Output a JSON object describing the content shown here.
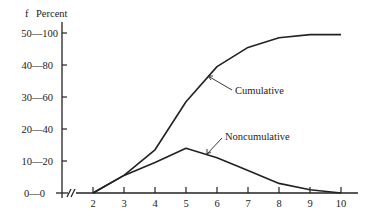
{
  "chart_data": {
    "type": "line",
    "title": "",
    "xlabel": "",
    "ylabel_left_f": "f",
    "ylabel_left_percent": "Percent",
    "x": [
      2,
      3,
      4,
      5,
      6,
      7,
      8,
      9,
      10
    ],
    "x_tick_labels": [
      "2",
      "3",
      "4",
      "5",
      "6",
      "7",
      "8",
      "9",
      "10"
    ],
    "y_ticks": [
      {
        "f": "0",
        "percent": "0",
        "label": "0—0"
      },
      {
        "f": "10",
        "percent": "20",
        "label": "10—20"
      },
      {
        "f": "20",
        "percent": "40",
        "label": "20—40"
      },
      {
        "f": "30",
        "percent": "60",
        "label": "30—60"
      },
      {
        "f": "40",
        "percent": "80",
        "label": "40—80"
      },
      {
        "f": "50",
        "percent": "100",
        "label": "50—100"
      }
    ],
    "ylim_percent": [
      0,
      100
    ],
    "ylim_f": [
      0,
      50
    ],
    "axis_break": true,
    "grid": false,
    "legend": "none (curves labeled directly with arrows)",
    "series": [
      {
        "name": "Cumulative",
        "unit": "percent",
        "values": [
          0,
          11,
          27,
          57,
          79,
          91,
          97,
          99,
          99
        ]
      },
      {
        "name": "Noncumulative",
        "unit": "percent",
        "values": [
          0,
          11,
          19,
          28,
          22,
          14,
          6,
          2,
          0
        ]
      }
    ],
    "annotations": [
      {
        "text": "Cumulative",
        "points_to_x": 5.6
      },
      {
        "text": "Noncumulative",
        "points_to_x": 5.7
      }
    ]
  },
  "labels": {
    "f": "f",
    "percent": "Percent",
    "cumulative": "Cumulative",
    "noncumulative": "Noncumulative",
    "y0": "0—0",
    "y10": "10—20",
    "y20": "20—40",
    "y30": "30—60",
    "y40": "40—80",
    "y50": "50—100",
    "x2": "2",
    "x3": "3",
    "x4": "4",
    "x5": "5",
    "x6": "6",
    "x7": "7",
    "x8": "8",
    "x9": "9",
    "x10": "10"
  }
}
